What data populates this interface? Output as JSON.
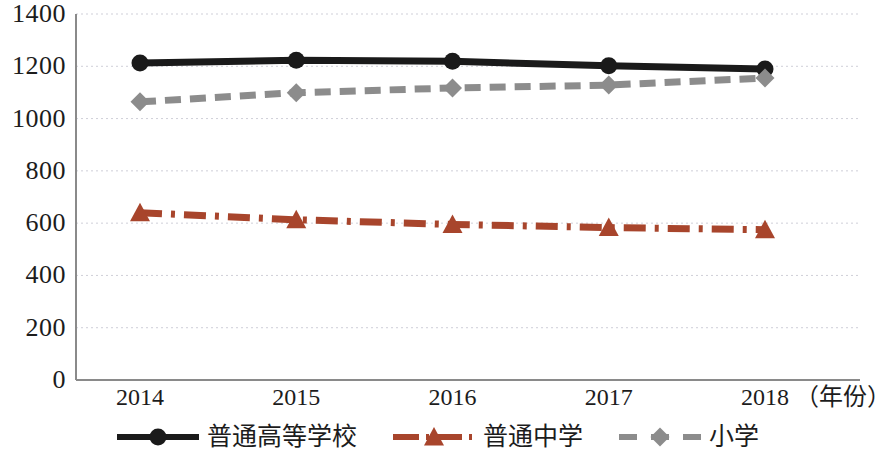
{
  "chart_data": {
    "type": "line",
    "title": "",
    "subtitle": "",
    "xlabel": "年份",
    "ylabel": "",
    "categories": [
      "2014",
      "2015",
      "2016",
      "2017",
      "2018"
    ],
    "x_axis_unit_label": "（年份）",
    "ylim": [
      0,
      1400
    ],
    "ytick_values": [
      0,
      200,
      400,
      600,
      800,
      1000,
      1200,
      1400
    ],
    "ytick_labels": [
      "0",
      "200",
      "400",
      "600",
      "800",
      "1000",
      "1200",
      "1400"
    ],
    "grid": true,
    "grid_style": "dotted-horizontal",
    "legend_position": "bottom-center",
    "series": [
      {
        "name": "普通高等学校",
        "values": [
          1213,
          1223,
          1219,
          1202,
          1190
        ],
        "color": "#1a1a1a",
        "line_style": "solid",
        "marker": "circle"
      },
      {
        "name": "普通中学",
        "values": [
          640,
          613,
          595,
          583,
          575
        ],
        "color": "#a8452c",
        "line_style": "dash-dot",
        "marker": "triangle"
      },
      {
        "name": "小学",
        "values": [
          1064,
          1099,
          1117,
          1128,
          1155
        ],
        "color": "#8c8c8c",
        "line_style": "dashed",
        "marker": "diamond"
      }
    ]
  },
  "colors": {
    "series_higher_education": "#1a1a1a",
    "series_secondary_school": "#a8452c",
    "series_primary_school": "#8c8c8c",
    "axis": "#808080",
    "grid": "#cfcfd8",
    "text": "#1c1c1c",
    "background": "#ffffff"
  },
  "legend": {
    "items": [
      {
        "label": "普通高等学校",
        "marker": "circle-marker"
      },
      {
        "label": "普通中学",
        "marker": "triangle-marker"
      },
      {
        "label": "小学",
        "marker": "diamond-marker"
      }
    ]
  }
}
